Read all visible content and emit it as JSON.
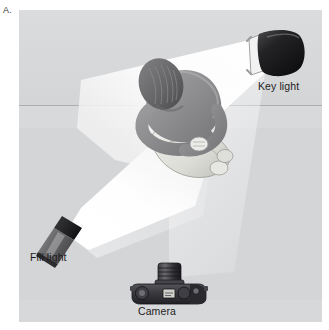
{
  "figure": {
    "panel_letter": "A.",
    "caption_kind": "photography-lighting-setup-diagram",
    "background_color": "#d4d5d7",
    "panel_border_color": "#c9cacc"
  },
  "labels": {
    "key_light": "Key light",
    "fill_light": "Fill light",
    "camera": "Camera"
  },
  "elements": {
    "subject": {
      "name": "seated person viewed from above",
      "skin_color": "#8f8f91",
      "hair_color": "#6e6e70",
      "clothing_color": "#dcdcd8"
    },
    "key_light": {
      "icon": "studio-light-fixture",
      "body_color": "#1b1b1b",
      "barn_door_color": "#f0f0f0",
      "position": "upper-right",
      "beam_color": "#ffffff"
    },
    "fill_light": {
      "icon": "studio-light-fixture",
      "body_color": "#6b6b6d",
      "snoot_color": "#1f1f1f",
      "position": "lower-left",
      "beam_color": "#ffffff"
    },
    "camera": {
      "icon": "slr-camera-top-view",
      "body_color": "#3a3a3c",
      "lens_color": "#2a2a2c",
      "position": "bottom-center"
    }
  }
}
